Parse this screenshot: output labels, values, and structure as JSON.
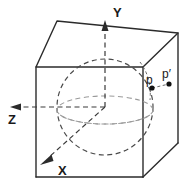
{
  "figure": {
    "axes": [
      {
        "id": "y",
        "label": "Y",
        "direction": "up",
        "label_x": 113,
        "label_y": 17
      },
      {
        "id": "z",
        "label": "Z",
        "direction": "left",
        "label_x": 8,
        "label_y": 124
      },
      {
        "id": "x",
        "label": "X",
        "direction": "down-left",
        "label_x": 58,
        "label_y": 175
      }
    ],
    "points": [
      {
        "id": "p",
        "label": "p",
        "label_x": 148,
        "label_y": 82,
        "dot_x": 152,
        "dot_y": 88
      },
      {
        "id": "p-prime",
        "label": "p′",
        "label_x": 164,
        "label_y": 77,
        "dot_x": 169,
        "dot_y": 84
      }
    ],
    "colors": {
      "background": "#ffffff",
      "cube_edge": "#2b2b2b",
      "sphere_outline": "#4a4a4a",
      "equator": "#9a9a9a",
      "axis": "#3a3a3a",
      "text": "#1a1a1a",
      "dot": "#111111"
    },
    "geometry": {
      "sphere_center_x": 105,
      "sphere_center_y": 107,
      "sphere_radius": 48,
      "origin_x": 105,
      "origin_y": 107
    }
  }
}
